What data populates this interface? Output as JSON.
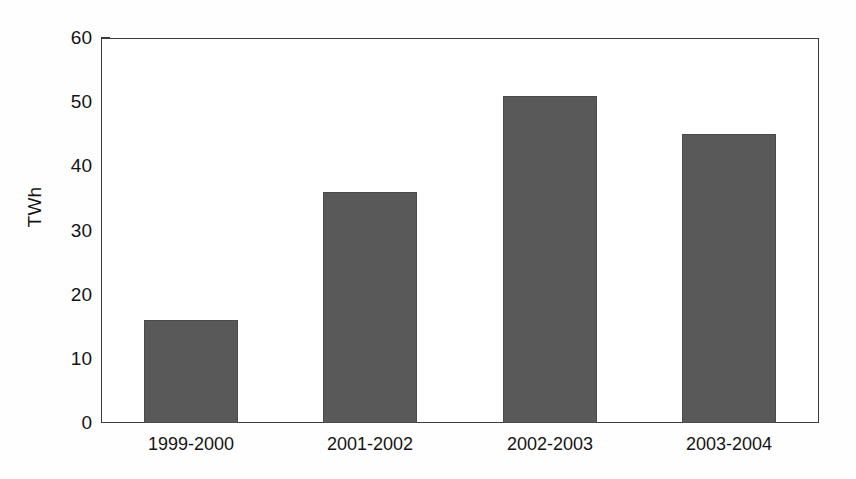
{
  "chart_data": {
    "type": "bar",
    "title": "",
    "subtitle": "",
    "xlabel": "",
    "ylabel": "TWh",
    "categories": [
      "1999-2000",
      "2001-2002",
      "2002-2003",
      "2003-2004"
    ],
    "values": [
      16,
      36,
      51,
      45
    ],
    "ylim": [
      0,
      60
    ],
    "yticks": [
      0,
      10,
      20,
      30,
      40,
      50,
      60
    ],
    "ytick_labels": [
      "0",
      "10",
      "20",
      "30",
      "40",
      "50",
      "60"
    ],
    "grid": false,
    "legend": null,
    "legend_position": "none",
    "annotations": [],
    "series": [
      {
        "name": "TWh",
        "color": "#595959",
        "values": [
          16,
          36,
          51,
          45
        ]
      }
    ],
    "colors": {
      "bar_fill": "#595959",
      "bar_edge": "#4a4a4a",
      "axis": "#3a3a3a",
      "text": "#141414",
      "background": "#fefefe",
      "plot_background": "#ffffff"
    }
  }
}
